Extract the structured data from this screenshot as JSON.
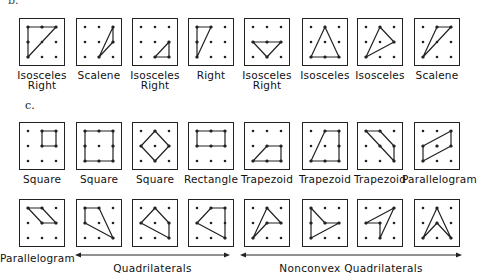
{
  "section_b": {
    "label": "b.",
    "figures": [
      {
        "name": "Isosceles Right",
        "lines": [
          "Isosceles",
          "Right"
        ],
        "poly": [
          [
            0,
            0
          ],
          [
            2,
            0
          ],
          [
            0,
            2
          ]
        ],
        "edge_dots": [
          [
            1,
            0
          ],
          [
            0,
            1
          ]
        ]
      },
      {
        "name": "Scalene",
        "lines": [
          "Scalene"
        ],
        "poly": [
          [
            2,
            0
          ],
          [
            2,
            1
          ],
          [
            1,
            2
          ]
        ],
        "edge_dots": []
      },
      {
        "name": "Isosceles Right",
        "lines": [
          "Isosceles",
          "Right"
        ],
        "poly": [
          [
            2,
            1
          ],
          [
            2,
            2
          ],
          [
            1,
            2
          ]
        ],
        "edge_dots": []
      },
      {
        "name": "Right",
        "lines": [
          "Right"
        ],
        "poly": [
          [
            0,
            0
          ],
          [
            1,
            0
          ],
          [
            0,
            2
          ]
        ],
        "edge_dots": [
          [
            0,
            1
          ]
        ]
      },
      {
        "name": "Isosceles Right",
        "lines": [
          "Isosceles",
          "Right"
        ],
        "poly": [
          [
            0,
            1
          ],
          [
            2,
            1
          ],
          [
            1,
            2
          ]
        ],
        "edge_dots": [
          [
            1,
            1
          ]
        ]
      },
      {
        "name": "Isosceles",
        "lines": [
          "Isosceles"
        ],
        "poly": [
          [
            1,
            0
          ],
          [
            2,
            2
          ],
          [
            0,
            2
          ]
        ],
        "edge_dots": [
          [
            1,
            2
          ]
        ]
      },
      {
        "name": "Isosceles",
        "lines": [
          "Isosceles"
        ],
        "poly": [
          [
            1,
            0
          ],
          [
            2,
            1
          ],
          [
            0,
            2
          ]
        ],
        "edge_dots": []
      },
      {
        "name": "Scalene",
        "lines": [
          "Scalene"
        ],
        "poly": [
          [
            1,
            0
          ],
          [
            2,
            0
          ],
          [
            0,
            2
          ]
        ],
        "edge_dots": []
      }
    ]
  },
  "section_c": {
    "label": "c.",
    "row1": [
      {
        "name": "Square",
        "lines": [
          "Square"
        ],
        "poly": [
          [
            1,
            0
          ],
          [
            2,
            0
          ],
          [
            2,
            1
          ],
          [
            1,
            1
          ]
        ],
        "edge_dots": []
      },
      {
        "name": "Square",
        "lines": [
          "Square"
        ],
        "poly": [
          [
            0,
            0
          ],
          [
            2,
            0
          ],
          [
            2,
            2
          ],
          [
            0,
            2
          ]
        ],
        "edge_dots": [
          [
            1,
            0
          ],
          [
            2,
            1
          ],
          [
            1,
            2
          ],
          [
            0,
            1
          ]
        ]
      },
      {
        "name": "Square",
        "lines": [
          "Square"
        ],
        "poly": [
          [
            1,
            0
          ],
          [
            2,
            1
          ],
          [
            1,
            2
          ],
          [
            0,
            1
          ]
        ],
        "edge_dots": []
      },
      {
        "name": "Rectangle",
        "lines": [
          "Rectangle"
        ],
        "poly": [
          [
            0,
            0
          ],
          [
            2,
            0
          ],
          [
            2,
            1
          ],
          [
            0,
            1
          ]
        ],
        "edge_dots": [
          [
            1,
            0
          ],
          [
            1,
            1
          ]
        ]
      },
      {
        "name": "Trapezoid",
        "lines": [
          "Trapezoid"
        ],
        "poly": [
          [
            1,
            1
          ],
          [
            2,
            1
          ],
          [
            2,
            2
          ],
          [
            0,
            2
          ]
        ],
        "edge_dots": [
          [
            1,
            2
          ]
        ]
      },
      {
        "name": "Trapezoid",
        "lines": [
          "Trapezoid"
        ],
        "poly": [
          [
            1,
            0
          ],
          [
            2,
            0
          ],
          [
            2,
            2
          ],
          [
            0,
            2
          ]
        ],
        "edge_dots": [
          [
            2,
            1
          ],
          [
            1,
            2
          ]
        ]
      },
      {
        "name": "Trapezoid",
        "lines": [
          "Trapezoid"
        ],
        "poly": [
          [
            0,
            0
          ],
          [
            1,
            0
          ],
          [
            2,
            1
          ],
          [
            2,
            2
          ]
        ],
        "edge_dots": [
          [
            1,
            1
          ]
        ]
      },
      {
        "name": "Parallelogram",
        "lines": [
          "Parallelogram"
        ],
        "poly": [
          [
            0,
            1
          ],
          [
            2,
            0
          ],
          [
            2,
            1
          ],
          [
            0,
            2
          ]
        ],
        "edge_dots": [
          [
            1,
            1
          ]
        ]
      }
    ],
    "row2": [
      {
        "name": "Parallelogram",
        "poly": [
          [
            0,
            0
          ],
          [
            1,
            0
          ],
          [
            2,
            1
          ],
          [
            1,
            1
          ]
        ],
        "edge_dots": []
      },
      {
        "name": "Quadrilateral",
        "poly": [
          [
            0,
            0
          ],
          [
            1,
            0
          ],
          [
            2,
            2
          ],
          [
            0,
            1
          ]
        ],
        "edge_dots": []
      },
      {
        "name": "Quadrilateral",
        "poly": [
          [
            1,
            0
          ],
          [
            2,
            1
          ],
          [
            2,
            2
          ],
          [
            0,
            1
          ]
        ],
        "edge_dots": []
      },
      {
        "name": "Quadrilateral",
        "poly": [
          [
            1,
            0
          ],
          [
            2,
            0
          ],
          [
            2,
            2
          ],
          [
            0,
            1
          ]
        ],
        "edge_dots": []
      },
      {
        "name": "Nonconvex Quadrilateral",
        "poly": [
          [
            1,
            0
          ],
          [
            2,
            1
          ],
          [
            1,
            1
          ],
          [
            0,
            2
          ]
        ],
        "edge_dots": []
      },
      {
        "name": "Nonconvex Quadrilateral",
        "poly": [
          [
            0,
            0
          ],
          [
            1,
            1
          ],
          [
            2,
            1
          ],
          [
            0,
            2
          ]
        ],
        "edge_dots": [
          [
            0,
            1
          ]
        ]
      },
      {
        "name": "Nonconvex Quadrilateral",
        "poly": [
          [
            2,
            0
          ],
          [
            1,
            2
          ],
          [
            1,
            1
          ],
          [
            0,
            1
          ]
        ],
        "edge_dots": []
      },
      {
        "name": "Nonconvex Quadrilateral",
        "poly": [
          [
            1,
            0
          ],
          [
            2,
            2
          ],
          [
            1,
            1
          ],
          [
            0,
            2
          ]
        ],
        "edge_dots": []
      }
    ],
    "row2_labels": {
      "parallelogram": "Parallelogram",
      "quadrilaterals": "Quadrilaterals",
      "nonconvex": "Nonconvex Quadrilaterals"
    }
  }
}
